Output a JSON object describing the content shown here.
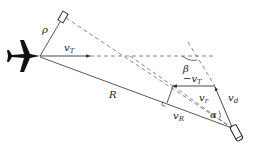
{
  "diagram": {
    "type": "missile-target engagement geometry",
    "colors": {
      "line": "#444444",
      "dashed": "#666666",
      "aircraft": "#111111",
      "background": "#ffffff"
    },
    "labels": {
      "rho": "ρ",
      "vT": "v",
      "vT_sub": "T",
      "neg_vT": "−v",
      "neg_vT_sub": "T",
      "beta": "β",
      "R": "R",
      "vr": "v",
      "vr_sub": "r",
      "vd": "v",
      "vd_sub": "d",
      "vR": "v",
      "vR_sub": "R",
      "alpha": "α"
    },
    "elements": [
      "aircraft-icon",
      "missile-icon",
      "box-marker-icon",
      "range-line",
      "rho-line",
      "vT-arrow",
      "neg-vT-arrow",
      "vd-arrow",
      "vr-dashed-line",
      "perpendicular-line",
      "right-angle-marks",
      "beta-arc",
      "alpha-arc"
    ]
  }
}
